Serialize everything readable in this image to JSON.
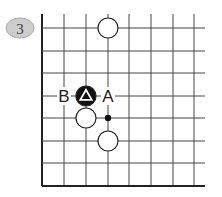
{
  "diagram": {
    "number": "3",
    "colors": {
      "line": "#444444",
      "edge": "#222222",
      "badge_fill": "#cccccc",
      "badge_stroke": "#aaaaaa",
      "black_stone": "#111111",
      "white_stone": "#ffffff",
      "stone_stroke": "#222222"
    },
    "grid": {
      "columns_x": [
        42,
        64,
        86,
        108,
        129,
        151,
        173,
        194
      ],
      "rows_y": [
        28,
        51,
        73,
        96,
        118,
        141,
        163,
        186
      ],
      "left_edge": true,
      "bottom_edge": true
    },
    "stones": [
      {
        "color": "white",
        "col": 3,
        "row": 0,
        "marker": ""
      },
      {
        "color": "black",
        "col": 2,
        "row": 3,
        "marker": "triangle"
      },
      {
        "color": "white",
        "col": 2,
        "row": 4,
        "marker": ""
      },
      {
        "color": "white",
        "col": 3,
        "row": 5,
        "marker": ""
      }
    ],
    "points": [
      {
        "col": 3,
        "row": 4,
        "marker": "dot"
      }
    ],
    "labels": [
      {
        "text": "B",
        "col": 1,
        "row": 3
      },
      {
        "text": "A",
        "col": 3,
        "row": 3
      }
    ]
  }
}
